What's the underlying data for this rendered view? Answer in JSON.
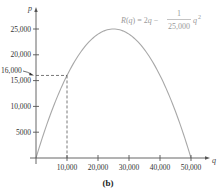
{
  "chart_data": {
    "type": "line",
    "title": "",
    "subtitle": "(b)",
    "xlabel": "q",
    "ylabel": "p",
    "function_label": {
      "lhs": "R(q) = 2q −",
      "numerator": "1",
      "denominator": "25,000",
      "suffix": "q",
      "exponent": "2"
    },
    "xlim": [
      0,
      55000
    ],
    "ylim": [
      0,
      27500
    ],
    "x_ticks": [
      10000,
      20000,
      30000,
      40000,
      50000
    ],
    "x_tick_labels": [
      "10,000",
      "20,000",
      "30,000",
      "40,000",
      "50,000"
    ],
    "y_ticks": [
      5000,
      10000,
      15000,
      20000,
      25000
    ],
    "y_tick_labels": [
      "5000",
      "10,000",
      "15,000",
      "20,000",
      "25,000"
    ],
    "annotation": {
      "label": "16,000",
      "point": [
        10000,
        16000
      ],
      "style": "dashed guide lines to axes with arrow from label"
    },
    "series": [
      {
        "name": "R(q)",
        "x": [
          0,
          5000,
          10000,
          15000,
          20000,
          25000,
          30000,
          35000,
          40000,
          45000,
          50000
        ],
        "values": [
          0,
          9000,
          16000,
          21000,
          24000,
          25000,
          24000,
          21000,
          16000,
          9000,
          0
        ],
        "color": "#a8a8a8"
      }
    ],
    "grid": false,
    "legend": "none"
  },
  "colors": {
    "axis": "#555555",
    "curve": "#a8a8a8",
    "dashed": "#555555",
    "equation": "#9a9a9a"
  }
}
